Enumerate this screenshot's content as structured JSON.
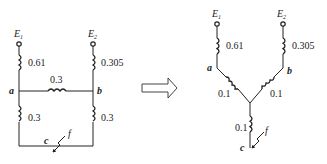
{
  "left_circuit": {
    "sources": [
      {
        "name": "E",
        "sub": "1"
      },
      {
        "name": "E",
        "sub": "2"
      }
    ],
    "reactances": {
      "e1_a": "0.61",
      "e2_b": "0.305",
      "a_b": "0.3",
      "a_c": "0.3",
      "b_c": "0.3"
    },
    "nodes": {
      "a": "a",
      "b": "b",
      "c": "c",
      "fault": "f"
    }
  },
  "arrow": {
    "direction": "right",
    "meaning": "transforms-to"
  },
  "right_circuit": {
    "sources": [
      {
        "name": "E",
        "sub": "1"
      },
      {
        "name": "E",
        "sub": "2"
      }
    ],
    "reactances": {
      "e1_a": "0.61",
      "e2_b": "0.305",
      "a_star": "0.1",
      "b_star": "0.1",
      "star_c": "0.1"
    },
    "nodes": {
      "a": "a",
      "b": "b",
      "c": "c",
      "fault": "f"
    }
  }
}
